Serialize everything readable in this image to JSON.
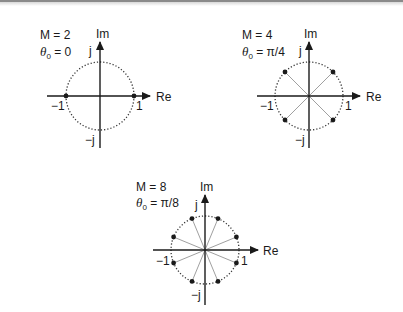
{
  "figure": {
    "colors": {
      "ink": "#1a1a1a",
      "spoke": "#a0a0a0",
      "circle": "#333333"
    },
    "axis_labels": {
      "real": "Re",
      "imag": "Im",
      "pos_real": "1",
      "neg_real": "−1",
      "pos_imag": "j",
      "neg_imag": "−j"
    },
    "panels": [
      {
        "id": "m2",
        "m_label": "M = 2",
        "theta_symbol": "θ",
        "theta_sub": "0",
        "theta_value": " = 0",
        "M": 2,
        "theta0": "0",
        "center": [
          100,
          96
        ],
        "radius": 34
      },
      {
        "id": "m4",
        "m_label": "M = 4",
        "theta_symbol": "θ",
        "theta_sub": "0",
        "theta_value": " = π/4",
        "M": 4,
        "theta0": "π/4",
        "center": [
          309,
          96
        ],
        "radius": 34
      },
      {
        "id": "m8",
        "m_label": "M = 8",
        "theta_symbol": "θ",
        "theta_sub": "0",
        "theta_value": " = π/8",
        "M": 8,
        "theta0": "π/8",
        "center": [
          205,
          250
        ],
        "radius": 34
      }
    ]
  }
}
